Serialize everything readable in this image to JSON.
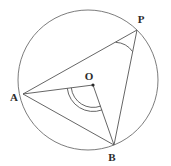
{
  "figure": {
    "type": "geometry-diagram",
    "canvas": {
      "width": 171,
      "height": 166
    },
    "background_color": "#ffffff",
    "stroke_color": "#5a5a5a",
    "label_color": "#2b2b2b",
    "circle": {
      "name": "main-circle",
      "center": {
        "x": 88,
        "y": 80
      },
      "radius": 70,
      "stroke_width": 0.9
    },
    "points": [
      {
        "id": "A",
        "label": "A",
        "x": 23,
        "y": 94,
        "label_x": 14,
        "label_y": 101,
        "on_circle": true,
        "dot": false
      },
      {
        "id": "P",
        "label": "P",
        "x": 137,
        "y": 30,
        "label_x": 141,
        "label_y": 23,
        "on_circle": true,
        "dot": false
      },
      {
        "id": "B",
        "label": "B",
        "x": 114,
        "y": 145,
        "label_x": 112,
        "label_y": 160,
        "on_circle": true,
        "dot": false
      },
      {
        "id": "O",
        "label": "O",
        "x": 93,
        "y": 85,
        "label_x": 88,
        "label_y": 80,
        "on_circle": false,
        "dot": true
      }
    ],
    "segments": [
      {
        "name": "segment-AP",
        "from": "A",
        "to": "P",
        "x1": 23,
        "y1": 94,
        "x2": 137,
        "y2": 30
      },
      {
        "name": "segment-AB",
        "from": "A",
        "to": "B",
        "x1": 23,
        "y1": 94,
        "x2": 114,
        "y2": 145
      },
      {
        "name": "segment-AO",
        "from": "A",
        "to": "O",
        "x1": 23,
        "y1": 94,
        "x2": 93,
        "y2": 85
      },
      {
        "name": "segment-OB",
        "from": "O",
        "to": "B",
        "x1": 93,
        "y1": 85,
        "x2": 114,
        "y2": 145
      },
      {
        "name": "segment-PB",
        "from": "P",
        "to": "B",
        "x1": 137,
        "y1": 30,
        "x2": 114,
        "y2": 145
      }
    ],
    "angle_marks": [
      {
        "name": "angle-APB",
        "vertex": "P",
        "arcs": 1,
        "radius": 22,
        "path": "M 115.6 42.3 A 22 22 0 0 1 132.6 51.6"
      },
      {
        "name": "angle-AOB",
        "vertex": "O",
        "arcs": 2,
        "radius_outer": 26,
        "radius_inner": 22,
        "path_outer": "M 67.3 88.3 A 26 26 0 0 0 102.1 109.9",
        "path_inner": "M 71.3 87.8 A 22 22 0 0 0 100.7 106.1"
      }
    ]
  }
}
